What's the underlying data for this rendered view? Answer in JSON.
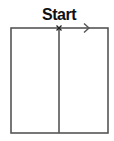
{
  "diagram": {
    "type": "maze-start-figure",
    "start_label": "Start",
    "colors": {
      "stroke": "#555555",
      "text": "#111111",
      "background": "#ffffff"
    },
    "rectangle": {
      "x": 11,
      "y": 28,
      "width": 97,
      "height": 105
    },
    "divider": {
      "x": 59
    },
    "start_marker": {
      "symbol": "x",
      "x": 59,
      "y": 28
    },
    "direction_arrow": {
      "direction": "right",
      "x": 87,
      "y": 28
    }
  }
}
